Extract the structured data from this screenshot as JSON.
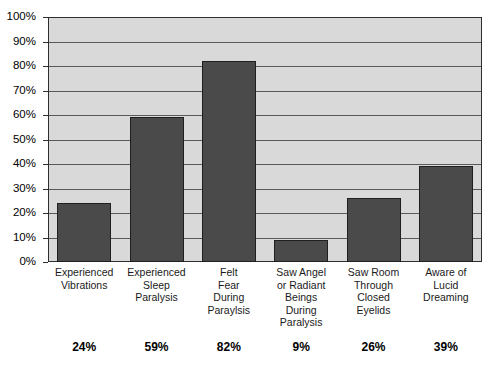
{
  "chart_data": {
    "type": "bar",
    "title": "",
    "xlabel": "",
    "ylabel": "",
    "ylim": [
      0,
      100
    ],
    "grid": true,
    "legend": "none",
    "orientation": "vertical",
    "bar_color": "#4a4a4a",
    "plot_background": "#d9d9d9",
    "categories": [
      "Experienced Vibrations",
      "Experienced Sleep Paralysis",
      "Felt Fear During Paraylsis",
      "Saw Angel or Radiant Beings During Paralysis",
      "Saw Room Through Closed Eyelids",
      "Aware of Lucid Dreaming"
    ],
    "category_lines": [
      [
        "Experienced",
        "Vibrations"
      ],
      [
        "Experienced",
        "Sleep",
        "Paralysis"
      ],
      [
        "Felt",
        "Fear",
        "During",
        "Paraylsis"
      ],
      [
        "Saw Angel",
        "or Radiant",
        "Beings",
        "During",
        "Paralysis"
      ],
      [
        "Saw Room",
        "Through",
        "Closed",
        "Eyelids"
      ],
      [
        "Aware of",
        "Lucid",
        "Dreaming"
      ]
    ],
    "values": [
      24,
      59,
      82,
      9,
      26,
      39
    ],
    "value_labels": [
      "24%",
      "59%",
      "82%",
      "9%",
      "26%",
      "39%"
    ],
    "y_ticks": [
      0,
      10,
      20,
      30,
      40,
      50,
      60,
      70,
      80,
      90,
      100
    ],
    "y_tick_labels": [
      "0%",
      "10%",
      "20%",
      "30%",
      "40%",
      "50%",
      "60%",
      "70%",
      "80%",
      "90%",
      "100%"
    ]
  }
}
